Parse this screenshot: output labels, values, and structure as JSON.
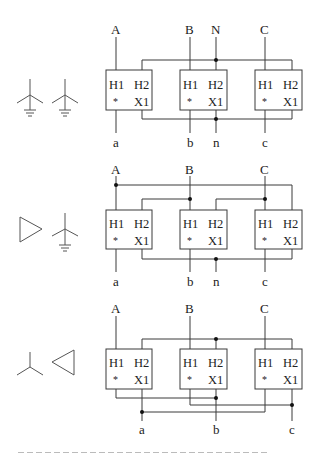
{
  "figure": {
    "type": "three-phase transformer connection diagrams",
    "panels": [
      {
        "id": "wye-wye",
        "primary_symbol": "grounded-wye",
        "secondary_symbol": "grounded-wye",
        "top_labels": [
          "A",
          "B",
          "N",
          "C"
        ],
        "bottom_labels": [
          "a",
          "b",
          "n",
          "c"
        ]
      },
      {
        "id": "delta-wye",
        "primary_symbol": "delta",
        "secondary_symbol": "grounded-wye",
        "top_labels": [
          "A",
          "B",
          "C"
        ],
        "bottom_labels": [
          "a",
          "b",
          "n",
          "c"
        ]
      },
      {
        "id": "wye-delta",
        "primary_symbol": "wye",
        "secondary_symbol": "delta",
        "top_labels": [
          "A",
          "B",
          "C"
        ],
        "bottom_labels": [
          "a",
          "b",
          "c"
        ]
      }
    ],
    "terminal_labels": {
      "h1": "H1",
      "h2": "H2",
      "x1": "X1",
      "polarity": "*"
    }
  },
  "labels": {
    "A": "A",
    "B": "B",
    "C": "C",
    "N": "N",
    "a": "a",
    "b": "b",
    "c": "c",
    "n": "n"
  }
}
